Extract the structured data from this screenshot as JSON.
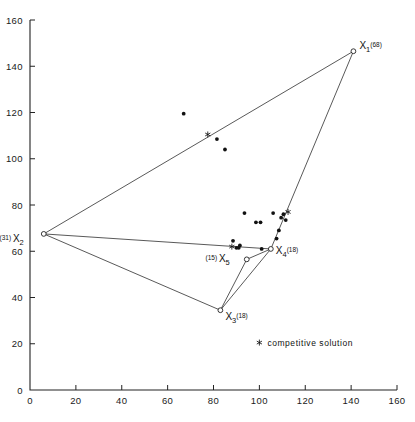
{
  "chart_data": {
    "type": "scatter",
    "title": "",
    "xlabel": "",
    "ylabel": "",
    "xlim": [
      0,
      160
    ],
    "ylim": [
      0,
      160
    ],
    "grid": false,
    "x_ticks": [
      0,
      20,
      40,
      60,
      80,
      100,
      120,
      140,
      160
    ],
    "y_ticks": [
      0,
      20,
      40,
      60,
      80,
      100,
      120,
      140,
      160
    ],
    "x_tick_labels": [
      "0",
      "20",
      "40",
      "60",
      "80",
      "100",
      "120",
      "140",
      "160"
    ],
    "y_tick_labels": [
      "0",
      "20",
      "40",
      "60",
      "80",
      "100",
      "120",
      "140",
      "160"
    ],
    "legend_position": "inside-lower-right",
    "series": [
      {
        "name": "facility nodes",
        "marker": "open-circle",
        "points": [
          {
            "id": "X1",
            "label": "X",
            "sub": "1",
            "sup": "(68)",
            "x": 141,
            "y": 146.5,
            "label_dx": 6,
            "label_dy": -2
          },
          {
            "id": "X2",
            "label": "X",
            "sub": "2",
            "sup": "",
            "paren": "(31)",
            "x": 6,
            "y": 67.5,
            "label_dx": -20,
            "label_dy": 8
          },
          {
            "id": "X3",
            "label": "X",
            "sub": "3",
            "sup": "(18)",
            "x": 83,
            "y": 34.5,
            "label_dx": 5,
            "label_dy": 10
          },
          {
            "id": "X4",
            "label": "X",
            "sub": "4",
            "sup": "(18)",
            "x": 105,
            "y": 61,
            "label_dx": 5,
            "label_dy": 5
          },
          {
            "id": "X5",
            "label": "X",
            "sub": "5",
            "sup": "",
            "paren": "(15)",
            "x": 94.5,
            "y": 56.5,
            "label_dx": -17,
            "label_dy": 3
          }
        ]
      },
      {
        "name": "demand points",
        "marker": "filled-dot",
        "points": [
          {
            "x": 67,
            "y": 119.5
          },
          {
            "x": 81.5,
            "y": 108.5
          },
          {
            "x": 85,
            "y": 104
          },
          {
            "x": 93.5,
            "y": 76.5
          },
          {
            "x": 98.5,
            "y": 72.5
          },
          {
            "x": 100.5,
            "y": 72.5
          },
          {
            "x": 106,
            "y": 76.5
          },
          {
            "x": 109.5,
            "y": 74.5
          },
          {
            "x": 111.5,
            "y": 73.5
          },
          {
            "x": 110.5,
            "y": 76
          },
          {
            "x": 108.5,
            "y": 69
          },
          {
            "x": 107.5,
            "y": 65.5
          },
          {
            "x": 88.5,
            "y": 64.5
          },
          {
            "x": 90,
            "y": 61.5
          },
          {
            "x": 91,
            "y": 61.5
          },
          {
            "x": 101,
            "y": 61
          },
          {
            "x": 91.5,
            "y": 62.5
          }
        ]
      },
      {
        "name": "competitive solution",
        "marker": "asterisk",
        "points": [
          {
            "x": 77.5,
            "y": 110.5
          },
          {
            "x": 112.5,
            "y": 77
          },
          {
            "x": 88,
            "y": 62
          }
        ]
      }
    ],
    "hull_edges": [
      {
        "from": "X2",
        "to": "X1"
      },
      {
        "from": "X1",
        "to": "X4"
      },
      {
        "from": "X2",
        "to": "X4"
      },
      {
        "from": "X2",
        "to": "X3"
      },
      {
        "from": "X3",
        "to": "X4"
      },
      {
        "from": "X3",
        "to": "X5"
      },
      {
        "from": "X5",
        "to": "X4"
      }
    ],
    "annotations": [
      {
        "name": "legend-entry",
        "text": "competitive solution",
        "x": 100,
        "y": 20.5,
        "marker": "asterisk"
      }
    ]
  },
  "legend": {
    "competitive_solution_label": "competitive solution",
    "marker_name": "asterisk-icon"
  },
  "node_labels": {
    "X1": {
      "base": "X",
      "sub": "1",
      "sup": "(68)"
    },
    "X2": {
      "base": "X",
      "sub": "2",
      "sup": "(31)"
    },
    "X3": {
      "base": "X",
      "sub": "3",
      "sup": "(18)"
    },
    "X4": {
      "base": "X",
      "sub": "4",
      "sup": "(18)"
    },
    "X5": {
      "base": "X",
      "sub": "5",
      "sup": "(15)"
    }
  },
  "colors": {
    "ink": "#111111",
    "axis": "#222222",
    "background": "#ffffff"
  }
}
